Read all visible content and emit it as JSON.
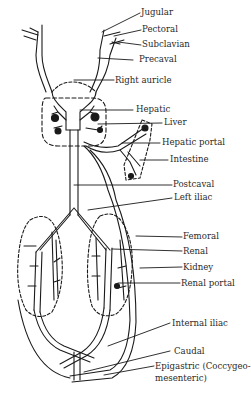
{
  "diagram": {
    "labels": {
      "jugular": "Jugular",
      "pectoral": "Pectoral",
      "subclavian": "Subclavian",
      "precaval": "Precaval",
      "right_auricle": "Right auricle",
      "hepatic": "Hepatic",
      "liver": "Liver",
      "hepatic_portal": "Hepatic portal",
      "intestine": "Intestine",
      "postcaval": "Postcaval",
      "left_iliac": "Left iliac",
      "femoral": "Femoral",
      "renal": "Renal",
      "kidney": "Kidney",
      "renal_portal": "Renal portal",
      "internal_iliac": "Internal iliac",
      "caudal": "Caudal",
      "epigastric_line1": "Epigastric (Coccygeo-",
      "epigastric_line2": "mesenteric)"
    },
    "colors": {
      "line": "#1a1a1a",
      "text": "#2a2a2a",
      "background": "#ffffff"
    }
  }
}
